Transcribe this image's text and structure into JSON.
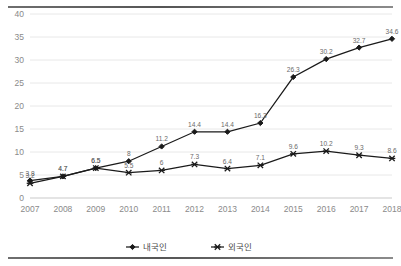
{
  "chart_data": {
    "type": "line",
    "title": "",
    "subtitle": "",
    "xlabel": "",
    "ylabel": "",
    "categories": [
      "2007",
      "2008",
      "2009",
      "2010",
      "2011",
      "2012",
      "2013",
      "2014",
      "2015",
      "2016",
      "2017",
      "2018"
    ],
    "ylim": [
      0,
      40
    ],
    "yticks": [
      0,
      5,
      10,
      15,
      20,
      25,
      30,
      35,
      40
    ],
    "ytick_labels": [
      "0",
      "5",
      "10",
      "15",
      "20",
      "25",
      "30",
      "35",
      "40"
    ],
    "grid": true,
    "legend_position": "bottom",
    "series": [
      {
        "name": "내국인",
        "marker": "diamond",
        "color": "#1a1a1a",
        "values": [
          3.8,
          4.7,
          6.5,
          8,
          11.2,
          14.4,
          14.4,
          16.3,
          26.3,
          30.2,
          32.7,
          34.6
        ],
        "labels": [
          "3.8",
          "4.7",
          "6.5",
          "8",
          "11.2",
          "14.4",
          "14.4",
          "16.3",
          "26.3",
          "30.2",
          "32.7",
          "34.6"
        ]
      },
      {
        "name": "외국인",
        "marker": "x",
        "color": "#1a1a1a",
        "values": [
          3.2,
          4.7,
          6.5,
          5.5,
          6,
          7.3,
          6.4,
          7.1,
          9.6,
          10.2,
          9.3,
          8.6
        ],
        "labels": [
          "3.2",
          "4.7",
          "6.5",
          "5.5",
          "6",
          "7.3",
          "6.4",
          "7.1",
          "9.6",
          "10.2",
          "9.3",
          "8.6"
        ]
      }
    ],
    "legend": [
      {
        "label": "내국인",
        "marker": "diamond"
      },
      {
        "label": "외국인",
        "marker": "x"
      }
    ]
  }
}
